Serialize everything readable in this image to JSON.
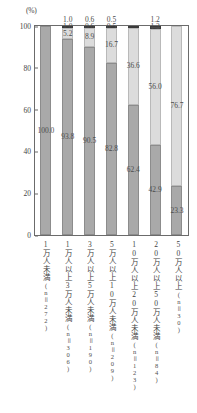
{
  "axis": {
    "unit": "(%)",
    "yticks": [
      "100",
      "80",
      "60",
      "40",
      "20",
      "0"
    ]
  },
  "chart_data": {
    "type": "bar",
    "title": "",
    "subtitle": "",
    "xlabel": "",
    "ylabel": "(%)",
    "ylim": [
      0,
      100
    ],
    "grid": false,
    "legend": "none",
    "stacked": true,
    "categories": [
      "1万人未満",
      "1万人以上3万人未満",
      "3万人以上5万人未満",
      "5万人以上10万人未満",
      "10万人以上20万人未満",
      "20万人以上50万人未満",
      "50万人以上"
    ],
    "category_counts": [
      "(n＝272)",
      "(n＝306)",
      "(n＝190)",
      "(n＝209)",
      "(n＝123)",
      "(n＝84)",
      "(n＝30)"
    ],
    "series": [
      {
        "name": "s-bot",
        "values": [
          0.0,
          5.2,
          8.9,
          16.7,
          36.6,
          56.0,
          76.7
        ]
      },
      {
        "name": "s-mid",
        "values": [
          100.0,
          93.8,
          90.5,
          82.8,
          62.4,
          42.9,
          23.3
        ]
      },
      {
        "name": "s-top",
        "values": [
          0.0,
          1.0,
          0.6,
          0.5,
          1.0,
          1.2,
          0.0
        ]
      }
    ],
    "bars": [
      {
        "category": "1万人未満",
        "count": "(n＝272)",
        "top": {
          "value": 0.0,
          "label": ""
        },
        "mid": {
          "value": 100.0,
          "label": "100.0"
        },
        "bot": {
          "value": 0.0,
          "label": ""
        }
      },
      {
        "category": "1万人以上3万人未満",
        "count": "(n＝306)",
        "top": {
          "value": 1.0,
          "label": "1.0"
        },
        "mid": {
          "value": 93.8,
          "label": "93.8"
        },
        "bot": {
          "value": 5.2,
          "label": "5.2"
        }
      },
      {
        "category": "3万人以上5万人未満",
        "count": "(n＝190)",
        "top": {
          "value": 0.6,
          "label": "0.6"
        },
        "mid": {
          "value": 90.5,
          "label": "90.5"
        },
        "bot": {
          "value": 8.9,
          "label": "8.9"
        }
      },
      {
        "category": "5万人以上10万人未満",
        "count": "(n＝209)",
        "top": {
          "value": 0.5,
          "label": "0.5"
        },
        "mid": {
          "value": 82.8,
          "label": "82.8"
        },
        "bot": {
          "value": 16.7,
          "label": "16.7"
        }
      },
      {
        "category": "10万人以上20万人未満",
        "count": "(n＝123)",
        "top": {
          "value": 1.0,
          "label": ""
        },
        "mid": {
          "value": 62.4,
          "label": "62.4"
        },
        "bot": {
          "value": 36.6,
          "label": "36.6"
        }
      },
      {
        "category": "20万人以上50万人未満",
        "count": "(n＝84)",
        "top": {
          "value": 1.2,
          "label": "1.2"
        },
        "mid": {
          "value": 42.9,
          "label": "42.9"
        },
        "bot": {
          "value": 56.0,
          "label": "56.0"
        }
      },
      {
        "category": "50万人以上",
        "count": "(n＝30)",
        "top": {
          "value": 0.0,
          "label": ""
        },
        "mid": {
          "value": 23.3,
          "label": "23.3"
        },
        "bot": {
          "value": 76.7,
          "label": "76.7"
        }
      }
    ],
    "colors": {
      "segment_top": "#4a4a4a",
      "segment_mid": "#a9a9a9",
      "segment_bot": "#dcdcdc",
      "axis": "#6b6b6b",
      "text": "#3f3f3f"
    }
  }
}
